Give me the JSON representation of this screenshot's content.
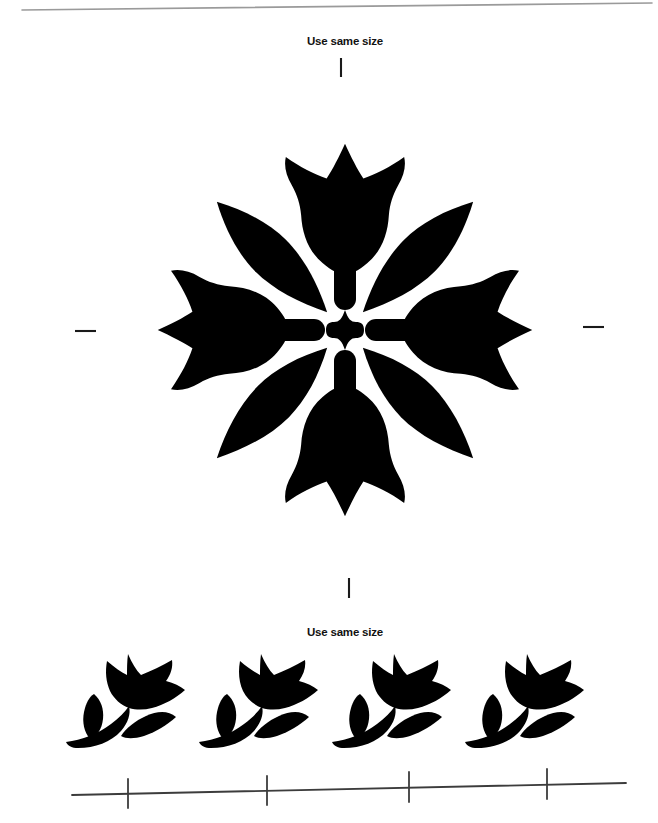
{
  "page": {
    "background_color": "#ffffff",
    "ink_color": "#000000",
    "rule_color": "#4a4a4a",
    "edge_color": "#9a9a9a",
    "width": 658,
    "height": 823
  },
  "labels": {
    "top": "Use same size",
    "bottom": "Use same size"
  },
  "top_edge_line": {
    "name": "page-edge-line",
    "x1": 22,
    "y1": 10,
    "x2": 652,
    "y2": 3,
    "color": "#9a9a9a",
    "width": 1.6
  },
  "registration_marks": {
    "top_tick": {
      "x": 341,
      "y1": 58,
      "y2": 77,
      "orientation": "vertical"
    },
    "bottom_tick": {
      "x": 349,
      "y1": 578,
      "y2": 598,
      "orientation": "vertical"
    },
    "left_dash": {
      "y": 331,
      "x1": 75,
      "x2": 96,
      "orientation": "horizontal"
    },
    "right_dash": {
      "y": 327,
      "x1": 583,
      "x2": 604,
      "orientation": "horizontal"
    }
  },
  "ruler": {
    "name": "measurement-ruler",
    "line": {
      "x1": 72,
      "y1": 795,
      "x2": 626,
      "y2": 783
    },
    "color": "#3c3c3c",
    "width": 1.8,
    "ticks": [
      {
        "x": 128,
        "y_top": 779,
        "y_bottom": 808
      },
      {
        "x": 267,
        "y_top": 776,
        "y_bottom": 805
      },
      {
        "x": 409,
        "y_top": 772,
        "y_bottom": 802
      },
      {
        "x": 547,
        "y_top": 769,
        "y_bottom": 799
      }
    ]
  },
  "medallion": {
    "name": "tulip-medallion",
    "center": {
      "x": 345,
      "y": 330
    },
    "description": "Four-way symmetric tulip medallion with central rosette",
    "tulips": [
      {
        "position": "top",
        "rotation": 0,
        "anchor_x": 345,
        "anchor_y": 205
      },
      {
        "position": "bottom",
        "rotation": 180,
        "anchor_x": 345,
        "anchor_y": 455
      },
      {
        "position": "left",
        "rotation": 270,
        "anchor_x": 220,
        "anchor_y": 330
      },
      {
        "position": "right",
        "rotation": 90,
        "anchor_x": 470,
        "anchor_y": 330
      }
    ],
    "rosette": {
      "center_quatrefoil": {
        "cx": 345,
        "cy": 330,
        "radius": 19
      },
      "cardinal_capsules": 4,
      "diagonal_leaves": 4
    }
  },
  "motif_row": {
    "name": "small-tulip-motif-row",
    "count": 4,
    "baseline_y": 700,
    "items": [
      {
        "index": 1,
        "cx": 122,
        "cy": 700
      },
      {
        "index": 2,
        "cx": 255,
        "cy": 700
      },
      {
        "index": 3,
        "cx": 388,
        "cy": 700
      },
      {
        "index": 4,
        "cx": 521,
        "cy": 700
      }
    ]
  }
}
